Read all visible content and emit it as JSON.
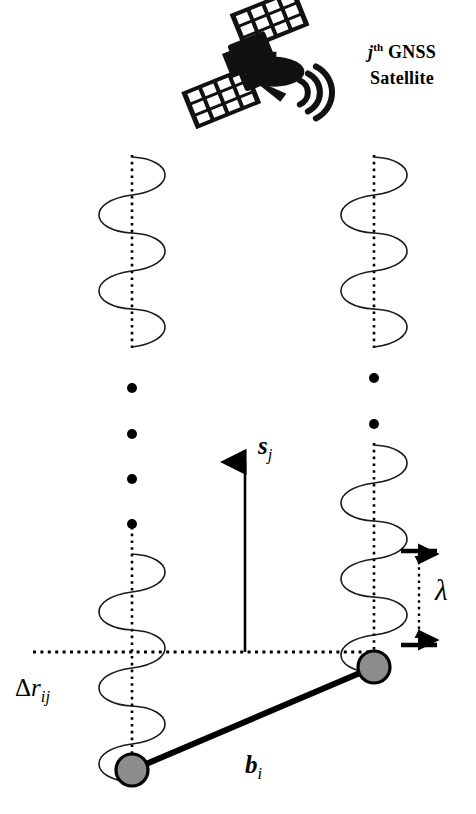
{
  "figure": {
    "type": "gnss-baseline-carrier-phase-diagram",
    "background_color": "#ffffff",
    "ink_color": "#000000",
    "node_fill_color": "#8c8c8c"
  },
  "satellite": {
    "icon": "satellite-icon",
    "caption_line1_prefix": "j",
    "caption_line1_superscript": "th",
    "caption_line1_suffix": " GNSS",
    "caption_line2": "Satellite"
  },
  "labels": {
    "unit_vector": {
      "symbol": "s",
      "subscript": "j",
      "name": "line-of-sight-unit-vector"
    },
    "wavelength": {
      "symbol": "λ",
      "name": "carrier-wavelength"
    },
    "range_difference": {
      "prefix": "Δ",
      "symbol": "r",
      "subscript": "ij",
      "name": "single-difference-range"
    },
    "baseline": {
      "symbol": "b",
      "subscript": "i",
      "name": "baseline-vector"
    }
  },
  "elements": {
    "wave_left_upper": "carrier-wave-left-upper",
    "wave_left_lower": "carrier-wave-left-lower",
    "wave_right_upper": "carrier-wave-right-upper",
    "wave_right_lower": "carrier-wave-right-lower",
    "ellipsis_left": "vertical-ellipsis-left",
    "ellipsis_right": "vertical-ellipsis-right",
    "axis_left": "dotted-axis-left",
    "axis_right": "dotted-axis-right",
    "reference_line": "horizontal-dotted-reference-line",
    "arrow_unit_vector": "unit-vector-arrow",
    "lambda_bracket": "wavelength-dimension-bracket",
    "node_upper": "receiver-node-upper-right",
    "node_lower": "receiver-node-lower-left",
    "baseline_segment": "baseline-segment"
  }
}
